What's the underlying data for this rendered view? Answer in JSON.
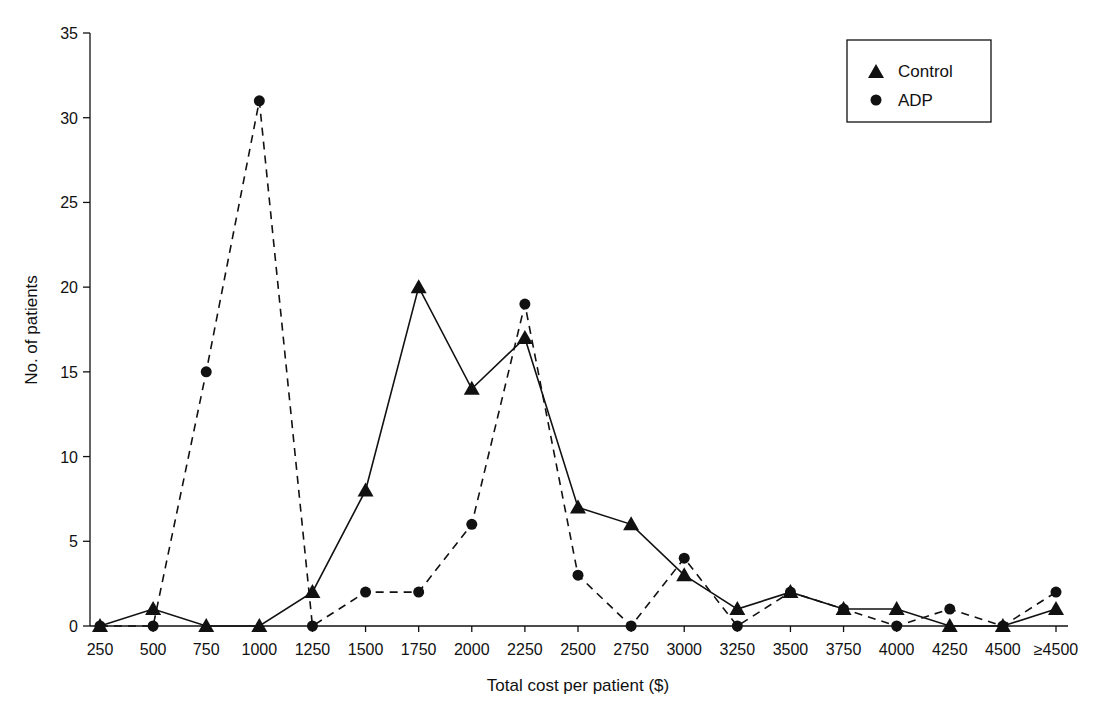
{
  "chart_data": {
    "type": "line",
    "title": "",
    "xlabel": "Total cost per patient ($)",
    "ylabel": "No. of patients",
    "categories": [
      "250",
      "500",
      "750",
      "1000",
      "1250",
      "1500",
      "1750",
      "2000",
      "2250",
      "2500",
      "2750",
      "3000",
      "3250",
      "3500",
      "3750",
      "4000",
      "4250",
      "4500",
      "≥4500"
    ],
    "ylim": [
      0,
      35
    ],
    "yticks": [
      0,
      5,
      10,
      15,
      20,
      25,
      30,
      35
    ],
    "grid": false,
    "legend_position": "upper right",
    "series": [
      {
        "name": "Control",
        "marker": "triangle",
        "line_style": "solid",
        "values": [
          0,
          1,
          0,
          0,
          2,
          8,
          20,
          14,
          17,
          7,
          6,
          3,
          1,
          2,
          1,
          1,
          0,
          0,
          1
        ]
      },
      {
        "name": "ADP",
        "marker": "circle",
        "line_style": "dashed",
        "values": [
          0,
          0,
          15,
          31,
          0,
          2,
          2,
          6,
          19,
          3,
          0,
          4,
          0,
          2,
          1,
          0,
          1,
          0,
          2
        ]
      }
    ]
  },
  "colors": {
    "line": "#111111",
    "background": "#ffffff"
  }
}
